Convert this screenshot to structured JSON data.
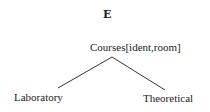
{
  "diagram": {
    "title": "E",
    "root": {
      "label": "Courses[ident,room]"
    },
    "children": [
      {
        "label": "Laboratory"
      },
      {
        "label": "Theoretical"
      }
    ],
    "edges": [
      {
        "from": "Courses[ident,room]",
        "to": "Laboratory"
      },
      {
        "from": "Courses[ident,room]",
        "to": "Theoretical"
      }
    ]
  }
}
